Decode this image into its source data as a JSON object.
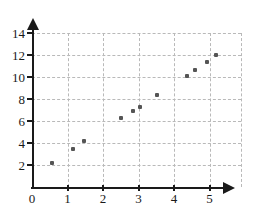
{
  "chart_data": {
    "type": "scatter",
    "title": "",
    "subtitle": "",
    "xlabel": "",
    "ylabel": "",
    "xlim": [
      0,
      5.9
    ],
    "ylim": [
      0,
      14.9
    ],
    "grid": true,
    "legend": null,
    "x_ticks": [
      0,
      1,
      2,
      3,
      4,
      5
    ],
    "x_tick_labels": [
      "0",
      "1",
      "2",
      "3",
      "4",
      "5"
    ],
    "y_ticks": [
      2,
      4,
      6,
      8,
      10,
      12,
      14
    ],
    "y_tick_labels": [
      "2",
      "4",
      "6",
      "8",
      "10",
      "12",
      "14"
    ],
    "marker_color": "#555555",
    "axis_color": "#1a1a1a",
    "grid_color": "#b9b9b9",
    "points": [
      {
        "x": 0.55,
        "y": 2.2
      },
      {
        "x": 1.15,
        "y": 3.5
      },
      {
        "x": 1.47,
        "y": 4.15
      },
      {
        "x": 2.5,
        "y": 6.3
      },
      {
        "x": 2.85,
        "y": 6.95
      },
      {
        "x": 3.05,
        "y": 7.3
      },
      {
        "x": 3.53,
        "y": 8.4
      },
      {
        "x": 4.37,
        "y": 10.1
      },
      {
        "x": 4.6,
        "y": 10.6
      },
      {
        "x": 4.93,
        "y": 11.4
      },
      {
        "x": 5.18,
        "y": 12.0
      }
    ]
  }
}
